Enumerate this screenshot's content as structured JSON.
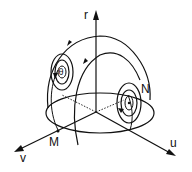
{
  "diagram": {
    "type": "3d-phase-portrait-hemisphere",
    "axes": {
      "r": "r",
      "u": "u",
      "v": "v"
    },
    "points": {
      "M": "M",
      "N": "N",
      "theta": "θ"
    },
    "colors": {
      "ink": "#111111",
      "background": "#ffffff"
    }
  }
}
